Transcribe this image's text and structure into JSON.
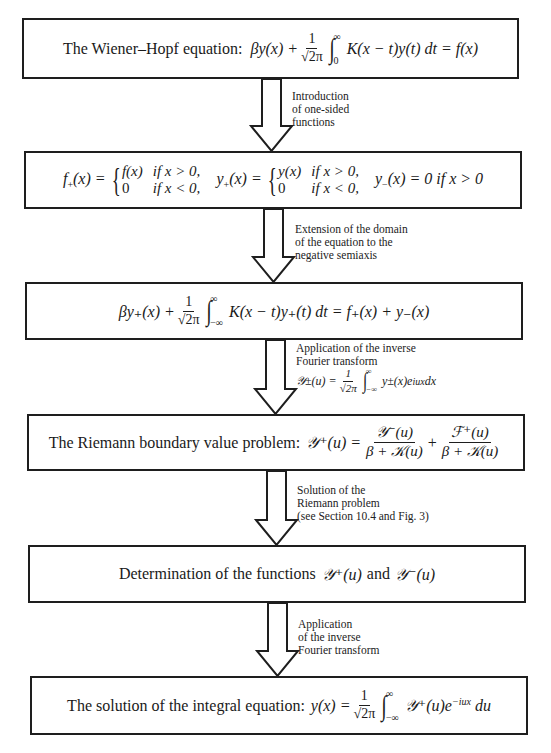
{
  "diagram": {
    "type": "flowchart",
    "direction": "top-to-bottom",
    "steps": [
      {
        "label": "The Wiener–Hopf equation:",
        "formula": "βy(x) + (1/√(2π)) ∫_0^∞ K(x − t) y(t) dt = f(x)",
        "parts": {
          "lhs1": "βy(x) +",
          "num": "1",
          "den": "√2π",
          "lo": "0",
          "hi": "∞",
          "rhs": "K(x − t)y(t) dt = f(x)"
        }
      },
      {
        "label": "",
        "formula": "f₊(x) = { f(x) if x > 0, 0 if x < 0 },  y₊(x) = { y(x) if x > 0, 0 if x < 0 },  y₋(x) = 0 if x > 0",
        "parts": {
          "f_plus": "f",
          "f_plus_sub": "+",
          "arg": "(x) =",
          "f_case1_val": "f(x)",
          "f_case1_cond": "if x > 0,",
          "f_case2_val": "0",
          "f_case2_cond": "if x < 0,",
          "y_plus": "y",
          "y_plus_sub": "+",
          "y_case1_val": "y(x)",
          "y_case1_cond": "if x > 0,",
          "y_case2_val": "0",
          "y_case2_cond": "if x < 0,",
          "y_minus": "y",
          "y_minus_sub": "−",
          "y_minus_rest": "(x) = 0  if x > 0"
        }
      },
      {
        "label": "",
        "formula": "βy₊(x) + (1/√(2π)) ∫_−∞^∞ K(x − t) y₊(t) dt = f₊(x) + y₋(x)",
        "parts": {
          "lhs1": "βy₊(x) +",
          "num": "1",
          "den": "√2π",
          "lo": "−∞",
          "hi": "∞",
          "rhs": "K(x − t)y₊(t) dt = f₊(x) + y₋(x)"
        }
      },
      {
        "label": "The Riemann boundary value problem:",
        "formula": "𝒴⁺(u) = 𝒴⁻(u)/(β + 𝒦(u)) + ℱ⁺(u)/(β + 𝒦(u))",
        "parts": {
          "lhs": "𝒴⁺(u) =",
          "num1": "𝒴⁻(u)",
          "den1": "β + 𝒦(u)",
          "plus": "+",
          "num2": "ℱ⁺(u)",
          "den2": "β + 𝒦(u)"
        }
      },
      {
        "label": "Determination of the functions",
        "formula": "𝒴⁺(u) and 𝒴⁻(u)",
        "parts": {
          "f1": "𝒴⁺(u)",
          "and": "and",
          "f2": "𝒴⁻(u)"
        }
      },
      {
        "label": "The solution of the integral equation:",
        "formula": "y(x) = (1/√(2π)) ∫_−∞^∞ 𝒴⁺(u) e^(−iux) du",
        "parts": {
          "lhs": "y(x) =",
          "num": "1",
          "den": "√2π",
          "lo": "−∞",
          "hi": "∞",
          "rhs_a": "𝒴⁺(u)e",
          "rhs_exp": "−iux",
          "rhs_b": " du"
        }
      }
    ],
    "transitions": [
      {
        "from": 1,
        "to": 2,
        "label_lines": [
          "Introduction",
          "of one-sided",
          "functions"
        ]
      },
      {
        "from": 2,
        "to": 3,
        "label_lines": [
          "Extension of the domain",
          "of the equation to the",
          "negative semiaxis"
        ]
      },
      {
        "from": 3,
        "to": 4,
        "label_lines": [
          "Application of the inverse",
          "Fourier transform"
        ],
        "formula": "𝒴^±(u) = (1/√(2π)) ∫_−∞^∞ y±(x) e^(iux) dx",
        "formula_parts": {
          "lhs": "𝒴±(u) =",
          "num": "1",
          "den": "√2π",
          "lo": "−∞",
          "hi": "∞",
          "rhs_a": "y±(x)e",
          "rhs_exp": "iux",
          "rhs_b": " dx"
        }
      },
      {
        "from": 4,
        "to": 5,
        "label_lines": [
          "Solution of the",
          "Riemann problem",
          "(see Section 10.4 and Fig. 3)"
        ]
      },
      {
        "from": 5,
        "to": 6,
        "label_lines": [
          "Application",
          "of  the inverse",
          "Fourier transform"
        ]
      }
    ],
    "colors": {
      "stroke": "#1e1e1e",
      "background": "#ffffff",
      "text": "#1a1a1a"
    }
  }
}
